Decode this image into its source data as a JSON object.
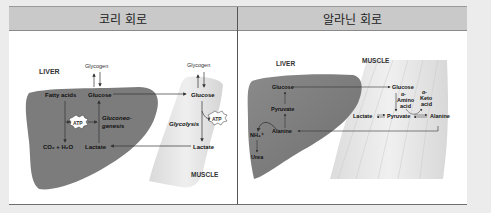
{
  "table": {
    "headers": [
      "코리 회로",
      "알라닌 회로"
    ]
  },
  "cori_cycle": {
    "title": "코리 회로",
    "liver_label": "LIVER",
    "muscle_label": "MUSCLE",
    "liver": {
      "glycogen": "Glycogen",
      "fatty_acids": "Fatty acids",
      "glucose": "Glucose",
      "atp": "ATP",
      "gluconeogenesis_1": "Gluconeo-",
      "gluconeogenesis_2": "genesis",
      "co2_h2o": "CO₂ + H₂O",
      "lactate": "Lactate"
    },
    "muscle": {
      "glycogen": "Glycogen",
      "glucose": "Glucose",
      "atp": "ATP",
      "glycolysis": "Glycolysis",
      "lactate": "Lactate"
    }
  },
  "alanine_cycle": {
    "title": "알라닌 회로",
    "liver_label": "LIVER",
    "muscle_label": "MUSCLE",
    "liver": {
      "glucose": "Glucose",
      "pyruvate": "Pyruvate",
      "alanine": "Alanine",
      "nh4": "NH₄⁺",
      "urea": "Urea"
    },
    "muscle": {
      "glucose": "Glucose",
      "lactate": "Lactate",
      "pyruvate": "Pyruvate",
      "alanine": "Alanine",
      "amino_acid_1": "α-",
      "amino_acid_2": "Amino",
      "amino_acid_3": "acid",
      "keto_acid_1": "α-",
      "keto_acid_2": "Keto",
      "keto_acid_3": "acid"
    }
  },
  "colors": {
    "liver_fill": "#7c7c7c",
    "muscle_fill": "#e3e3e3",
    "header_bg": "#c9c9c9",
    "page_bg": "#ececec"
  }
}
